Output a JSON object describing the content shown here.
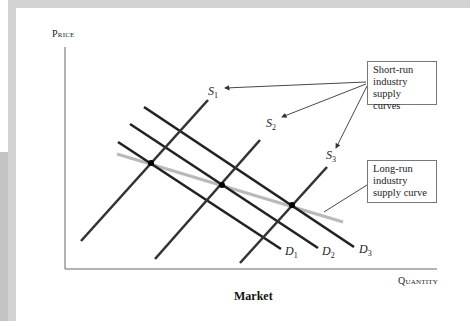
{
  "diagram": {
    "y_axis_label": "Price",
    "x_axis_label": "Quantity",
    "caption": "Market",
    "callouts": {
      "short_run": [
        "Short-run",
        "industry",
        "supply curves"
      ],
      "long_run": [
        "Long-run",
        "industry",
        "supply curve"
      ]
    },
    "supply_curves": [
      {
        "name": "S",
        "sub": "1"
      },
      {
        "name": "S",
        "sub": "2"
      },
      {
        "name": "S",
        "sub": "3"
      }
    ],
    "demand_curves": [
      {
        "name": "D",
        "sub": "1"
      },
      {
        "name": "D",
        "sub": "2"
      },
      {
        "name": "D",
        "sub": "3"
      }
    ],
    "colors": {
      "curve": "#222222",
      "long_run_curve": "#b9b9b9",
      "axis": "#555555",
      "frame": "#d3d3d3"
    }
  }
}
